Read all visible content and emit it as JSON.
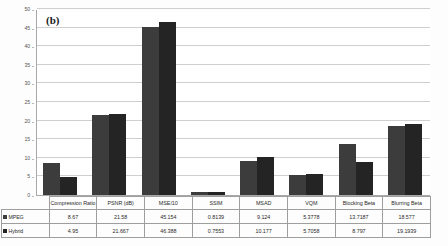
{
  "figure": {
    "panel_label": "(b)"
  },
  "chart_data": {
    "type": "bar",
    "title": "(b)",
    "xlabel": "",
    "ylabel": "",
    "ylim": [
      0,
      50
    ],
    "yticks": [
      0,
      5,
      10,
      15,
      20,
      25,
      30,
      35,
      40,
      45,
      50
    ],
    "grid": true,
    "legend_position": "table-left",
    "categories": [
      "Compression Ratio",
      "PSNR (dB)",
      "MSE/10",
      "SSIM",
      "MSAD",
      "VQM",
      "Blocking Beta",
      "Blurring Beta"
    ],
    "series": [
      {
        "name": "MPEG",
        "color": "#3c3c3c",
        "values": [
          8.67,
          21.58,
          45.154,
          0.8139,
          9.124,
          5.3778,
          13.7187,
          18.577
        ],
        "labels": [
          "8.67",
          "21.58",
          "45.154",
          "0.8139",
          "9.124",
          "5.3778",
          "13.7187",
          "18.577"
        ]
      },
      {
        "name": "Hybrid",
        "color": "#242424",
        "values": [
          4.95,
          21.667,
          46.388,
          0.7553,
          10.177,
          5.7058,
          8.797,
          19.1939
        ],
        "labels": [
          "4.95",
          "21.667",
          "46.388",
          "0.7553",
          "10.177",
          "5.7058",
          "8.797",
          "19.1939"
        ]
      }
    ]
  },
  "table": {
    "corner_label": "",
    "row_headers": [
      "MPEG",
      "Hybrid"
    ]
  }
}
